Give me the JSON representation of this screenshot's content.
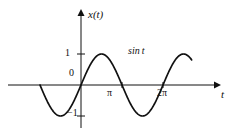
{
  "figure": {
    "background_color": "#ffffff",
    "line_color": "#111111",
    "width": 232,
    "height": 135
  },
  "axes": {
    "y_axis_label": "x(t)",
    "x_axis_label": "t",
    "origin_label": "0"
  },
  "ticks": {
    "y": [
      {
        "label": "1",
        "value": 1
      },
      {
        "label": "−1",
        "value": -1
      }
    ],
    "x": [
      {
        "label": "π",
        "value": 3.14159
      },
      {
        "label": "2π",
        "value": 6.28319
      }
    ]
  },
  "annotations": {
    "curve_label": "sin t"
  },
  "chart_data": {
    "type": "line",
    "title": "",
    "subtitle": "",
    "xlabel": "t",
    "ylabel": "x(t)",
    "xlim": [
      -1.8,
      8.6
    ],
    "ylim": [
      -1.35,
      1.35
    ],
    "grid": false,
    "legend": "none",
    "x_tick_labels": [
      "π",
      "2π"
    ],
    "x_tick_values": [
      3.14159,
      6.28319
    ],
    "y_tick_labels": [
      "1",
      "0",
      "−1"
    ],
    "y_tick_values": [
      1,
      0,
      -1
    ],
    "annotations": [
      {
        "text": "sin t",
        "x": 4.3,
        "y": 1.15
      }
    ],
    "series": [
      {
        "name": "sin t",
        "function": "sin(t)",
        "x_start": -3.14159,
        "x_end": 8.48,
        "amplitude": 1,
        "period": 6.28319,
        "x": [
          -3.1416,
          -2.9,
          -2.6,
          -2.3,
          -2.0,
          -1.7,
          -1.5708,
          -1.4,
          -1.1,
          -0.8,
          -0.5,
          -0.2,
          0.0,
          0.3,
          0.6,
          0.9,
          1.2,
          1.5708,
          1.9,
          2.2,
          2.5,
          2.8,
          3.1416,
          3.5,
          3.8,
          4.1,
          4.4,
          4.7124,
          5.0,
          5.3,
          5.6,
          5.9,
          6.2832,
          6.6,
          6.9,
          7.2,
          7.5,
          7.854,
          8.2,
          8.48
        ],
        "y": [
          0.0,
          -0.2392,
          -0.5155,
          -0.7457,
          -0.9093,
          -0.9917,
          -1.0,
          -0.9854,
          -0.8912,
          -0.7174,
          -0.4794,
          -0.1987,
          0.0,
          0.2955,
          0.5646,
          0.7833,
          0.932,
          1.0,
          0.9463,
          0.8085,
          0.5985,
          0.335,
          0.0,
          -0.3508,
          -0.6119,
          -0.8183,
          -0.9516,
          -1.0,
          -0.9589,
          -0.8323,
          -0.6313,
          -0.3738,
          0.0,
          0.3115,
          0.5784,
          0.7937,
          0.938,
          1.0,
          0.9407,
          0.8111
        ]
      }
    ]
  }
}
